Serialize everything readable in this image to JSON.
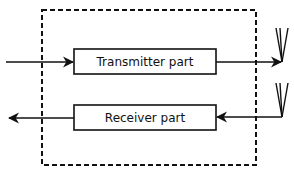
{
  "diagram": {
    "type": "block-diagram",
    "container": {
      "style": "dashed",
      "label": ""
    },
    "blocks": [
      {
        "id": "transmitter",
        "label": "Transmitter part"
      },
      {
        "id": "receiver",
        "label": "Receiver part"
      }
    ],
    "connections": [
      {
        "from": "external-input",
        "to": "transmitter",
        "direction": "right"
      },
      {
        "from": "transmitter",
        "to": "antenna-top",
        "direction": "right"
      },
      {
        "from": "antenna-bottom",
        "to": "receiver",
        "direction": "left"
      },
      {
        "from": "receiver",
        "to": "external-output",
        "direction": "left"
      }
    ],
    "antennas": [
      {
        "id": "antenna-top",
        "icon": "antenna-icon"
      },
      {
        "id": "antenna-bottom",
        "icon": "antenna-icon"
      }
    ],
    "colors": {
      "stroke": "#111111",
      "background": "#ffffff"
    }
  }
}
